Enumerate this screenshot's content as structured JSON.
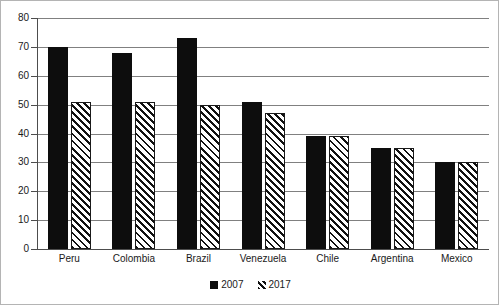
{
  "chart_data": {
    "type": "bar",
    "title": "",
    "subtitle": "",
    "xlabel": "",
    "ylabel": "",
    "categories": [
      "Peru",
      "Colombia",
      "Brazil",
      "Venezuela",
      "Chile",
      "Argentina",
      "Mexico"
    ],
    "series": [
      {
        "name": "2007",
        "values": [
          70,
          68,
          73,
          51,
          39,
          35,
          30
        ],
        "fill": "solid-black",
        "color": "#0d0d0d"
      },
      {
        "name": "2017",
        "values": [
          51,
          51,
          50,
          47,
          39,
          35,
          30
        ],
        "fill": "diagonal-hatch",
        "color": "#111111"
      }
    ],
    "ylim": [
      0,
      80
    ],
    "ytick_step": 10,
    "ytick_labels": [
      "0",
      "10",
      "20",
      "30",
      "40",
      "50",
      "60",
      "70",
      "80"
    ],
    "ytick_values": [
      0,
      10,
      20,
      30,
      40,
      50,
      60,
      70,
      80
    ],
    "grid": true,
    "grid_axis": "y",
    "legend_position": "bottom-center",
    "legend_entries": [
      "2007",
      "2017"
    ],
    "annotations": [],
    "colors": {
      "series_2007": "#0d0d0d",
      "series_2017_hatch": "#111111",
      "gridline": "#808080",
      "axis": "#4d4d4d",
      "border": "#b4b4b4",
      "background": "#ffffff",
      "text": "#1a1a1a"
    }
  }
}
